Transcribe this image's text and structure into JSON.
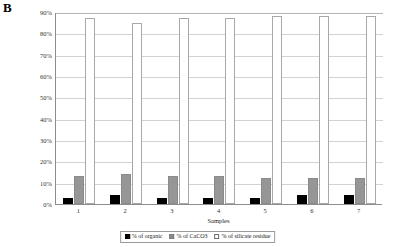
{
  "panel": {
    "label": "B"
  },
  "chart_data": {
    "type": "bar",
    "title": "",
    "subtitle": "",
    "xlabel": "Samples",
    "ylabel": "",
    "categories": [
      "1",
      "2",
      "3",
      "4",
      "5",
      "6",
      "7"
    ],
    "series": [
      {
        "name": "% of organic",
        "color": "#000000",
        "values": [
          3,
          4,
          3,
          3,
          3,
          4,
          4
        ]
      },
      {
        "name": "% of CaCO3",
        "color": "#969696",
        "values": [
          13,
          14,
          13,
          13,
          12,
          12,
          12
        ]
      },
      {
        "name": "% of silicate residue",
        "color": "#ffffff",
        "values": [
          87,
          85,
          87,
          87,
          88,
          88,
          88
        ]
      }
    ],
    "ylim": [
      0,
      90
    ],
    "ytick_values": [
      0,
      10,
      20,
      30,
      40,
      50,
      60,
      70,
      80,
      90
    ],
    "ytick_labels": [
      "0%",
      "10%",
      "20%",
      "30%",
      "40%",
      "50%",
      "60%",
      "70%",
      "80%",
      "90%"
    ],
    "grid": true,
    "grid_axis": "y",
    "legend_position": "bottom",
    "legend_entries": [
      "% of organic",
      "% of CaCO3",
      "% of silicate residue"
    ]
  },
  "axes": {
    "x_title": "Samples"
  }
}
